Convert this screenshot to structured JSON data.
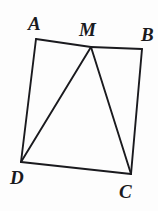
{
  "figure": {
    "kind": "geometry-diagram",
    "background_color": "#fdfdfd",
    "stroke_color": "#1a1a1e",
    "stroke_width": 1.9,
    "canvas": {
      "width": 158,
      "height": 211
    },
    "points": [
      {
        "id": "A",
        "label": "A",
        "x": 36,
        "y": 39,
        "label_x": 28,
        "label_y": 14
      },
      {
        "id": "M",
        "label": "M",
        "x": 91,
        "y": 47,
        "label_x": 79,
        "label_y": 20
      },
      {
        "id": "B",
        "label": "B",
        "x": 142,
        "y": 49,
        "label_x": 141,
        "label_y": 25
      },
      {
        "id": "C",
        "label": "C",
        "x": 131,
        "y": 174,
        "label_x": 119,
        "label_y": 182
      },
      {
        "id": "D",
        "label": "D",
        "x": 21,
        "y": 162,
        "label_x": 10,
        "label_y": 168
      }
    ],
    "segments": [
      {
        "id": "AM",
        "name": "segment-am",
        "from": "A",
        "to": "M"
      },
      {
        "id": "MB",
        "name": "segment-mb",
        "from": "M",
        "to": "B"
      },
      {
        "id": "BC",
        "name": "segment-bc",
        "from": "B",
        "to": "C"
      },
      {
        "id": "CD",
        "name": "segment-cd",
        "from": "C",
        "to": "D"
      },
      {
        "id": "DA",
        "name": "segment-da",
        "from": "D",
        "to": "A"
      },
      {
        "id": "MD",
        "name": "segment-md-diagonal",
        "from": "M",
        "to": "D"
      },
      {
        "id": "MC",
        "name": "segment-mc-diagonal",
        "from": "M",
        "to": "C"
      }
    ]
  }
}
